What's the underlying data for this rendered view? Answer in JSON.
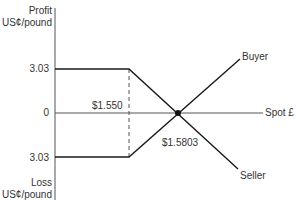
{
  "y_axis": {
    "top_label_line1": "Profit",
    "top_label_line2": "US¢/pound",
    "bottom_label_line1": "Loss",
    "bottom_label_line2": "US¢/pound",
    "ticks": [
      "3.03",
      "0",
      "3.03"
    ]
  },
  "x_axis": {
    "label": "Spot £"
  },
  "annotations": {
    "strike": "$1.550",
    "breakeven": "$1.5803"
  },
  "lines": {
    "buyer": "Buyer",
    "seller": "Seller"
  },
  "colors": {
    "line": "#1a1a1a",
    "axis": "#555555"
  }
}
